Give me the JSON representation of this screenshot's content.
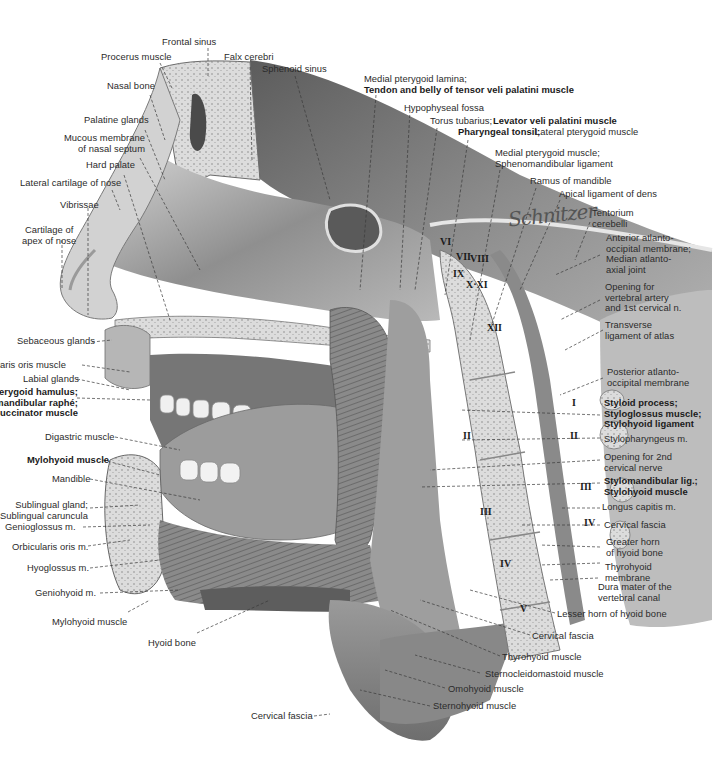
{
  "figure": {
    "type": "anatomical-illustration",
    "signature": "Schnitzer"
  },
  "labels": {
    "top": [
      {
        "id": "frontal-sinus",
        "text": "Frontal sinus",
        "bold": false
      },
      {
        "id": "procerus-muscle",
        "text": "Procerus muscle",
        "bold": false
      },
      {
        "id": "falx-cerebri",
        "text": "Falx cerebri",
        "bold": false
      },
      {
        "id": "sphenoid-sinus",
        "text": "Sphenoid sinus",
        "bold": false
      },
      {
        "id": "medial-pterygoid-lamina",
        "text": "Medial pterygoid lamina;",
        "bold": false
      },
      {
        "id": "tendon-tensor-veli-palatini",
        "text": "Tendon and belly of tensor veli palatini muscle",
        "bold": true
      },
      {
        "id": "hypophyseal-fossa",
        "text": "Hypophyseal fossa",
        "bold": false
      },
      {
        "id": "torus-tubarius",
        "text": "Torus tubarius;",
        "bold": false
      },
      {
        "id": "levator-veli-palatini",
        "text": "Levator veli palatini muscle",
        "bold": true
      },
      {
        "id": "pharyngeal-tonsil",
        "text": "Pharyngeal tonsil;",
        "bold": true
      },
      {
        "id": "lateral-pterygoid",
        "text": "Lateral pterygoid muscle",
        "bold": false
      },
      {
        "id": "medial-pterygoid-muscle",
        "text": "Medial pterygoid muscle;\nSphenomandibular ligament",
        "bold": false
      },
      {
        "id": "ramus-of-mandible",
        "text": "Ramus of mandible",
        "bold": false
      },
      {
        "id": "apical-ligament",
        "text": "Apical ligament of dens",
        "bold": false
      }
    ],
    "left": [
      {
        "id": "nasal-bone",
        "text": "Nasal bone",
        "bold": false
      },
      {
        "id": "palatine-glands",
        "text": "Palatine glands",
        "bold": false
      },
      {
        "id": "mucous-membrane-septum",
        "text": "Mucous membrane\nof nasal septum",
        "bold": false
      },
      {
        "id": "hard-palate",
        "text": "Hard palate",
        "bold": false
      },
      {
        "id": "lateral-cartilage-nose",
        "text": "Lateral cartilage of nose",
        "bold": false
      },
      {
        "id": "vibrissae",
        "text": "Vibrissae",
        "bold": false
      },
      {
        "id": "cartilage-apex-nose",
        "text": "Cartilage of\napex of nose",
        "bold": false
      },
      {
        "id": "sebaceous-glands",
        "text": "Sebaceous glands",
        "bold": false
      },
      {
        "id": "orbicularis-oris-muscle",
        "text": "Orbicularis oris muscle",
        "bold": false
      },
      {
        "id": "labial-glands",
        "text": "Labial glands",
        "bold": false
      },
      {
        "id": "pterygoid-hamulus",
        "text": "Pterygoid hamulus;\nPterygomandibular raphé;\nBuccinator muscle",
        "bold": true
      },
      {
        "id": "digastric-muscle",
        "text": "Digastric muscle",
        "bold": false
      },
      {
        "id": "mylohyoid-muscle-bold",
        "text": "Mylohyoid muscle",
        "bold": true
      },
      {
        "id": "mandible",
        "text": "Mandible",
        "bold": false
      },
      {
        "id": "sublingual-gland",
        "text": "Sublingual gland;\nSublingual caruncula",
        "bold": false
      },
      {
        "id": "genioglossus",
        "text": "Genioglossus m.",
        "bold": false
      },
      {
        "id": "orbicularis-oris-m",
        "text": "Orbicularis oris m.",
        "bold": false
      },
      {
        "id": "hyoglossus",
        "text": "Hyoglossus m.",
        "bold": false
      },
      {
        "id": "geniohyoid",
        "text": "Geniohyoid m.",
        "bold": false
      },
      {
        "id": "mylohyoid-muscle",
        "text": "Mylohyoid muscle",
        "bold": false
      },
      {
        "id": "hyoid-bone",
        "text": "Hyoid bone",
        "bold": false
      }
    ],
    "right": [
      {
        "id": "tentorium-cerebelli",
        "text": "Tentorium\ncerebelli",
        "bold": false
      },
      {
        "id": "anterior-atlanto-occipital",
        "text": "Anterior atlanto-\noccipital membrane;\nMedian atlanto-\naxial joint",
        "bold": false
      },
      {
        "id": "opening-vertebral-artery",
        "text": "Opening for\nvertebral artery\nand 1st cervical n.",
        "bold": false
      },
      {
        "id": "transverse-ligament",
        "text": "Transverse\nligament of atlas",
        "bold": false
      },
      {
        "id": "posterior-atlanto-occipital",
        "text": "Posterior atlanto-\noccipital membrane",
        "bold": false
      },
      {
        "id": "styloid-process",
        "text": "Styloid process;\nStyloglossus muscle;\nStylohyoid ligament",
        "bold": true
      },
      {
        "id": "stylopharyngeus",
        "text": "Stylopharyngeus m.",
        "bold": false
      },
      {
        "id": "opening-2nd-cervical",
        "text": "Opening for 2nd\ncervical nerve",
        "bold": false
      },
      {
        "id": "stylomandibular",
        "text": "Stylomandibular lig.;\nStylohyoid muscle",
        "bold": true
      },
      {
        "id": "longus-capitis",
        "text": "Longus capitis m.",
        "bold": false
      },
      {
        "id": "cervical-fascia-r",
        "text": "Cervical fascia",
        "bold": false
      },
      {
        "id": "greater-horn-hyoid",
        "text": "Greater horn\nof hyoid bone",
        "bold": false
      },
      {
        "id": "thyrohyoid-membrane",
        "text": "Thyrohyoid\nmembrane",
        "bold": false
      },
      {
        "id": "dura-mater",
        "text": "Dura mater of the\nvertebral canal",
        "bold": false
      }
    ],
    "bottom": [
      {
        "id": "lesser-horn-hyoid",
        "text": "Lesser horn of hyoid bone",
        "bold": false
      },
      {
        "id": "cervical-fascia-b",
        "text": "Cervical fascia",
        "bold": false
      },
      {
        "id": "thyrohyoid-muscle",
        "text": "Thyrohyoid muscle",
        "bold": false
      },
      {
        "id": "sternocleidomastoid",
        "text": "Sternocleidomastoid muscle",
        "bold": false
      },
      {
        "id": "omohyoid",
        "text": "Omohyoid muscle",
        "bold": false
      },
      {
        "id": "sternohyoid",
        "text": "Sternohyoid muscle",
        "bold": false
      },
      {
        "id": "cervical-fascia-bl",
        "text": "Cervical fascia",
        "bold": false
      }
    ]
  },
  "cranial_nerves": [
    "VI",
    "VII",
    "VIII",
    "IX",
    "X·XI",
    "XII"
  ],
  "vertebrae_anterior": [
    "II",
    "III",
    "IV",
    "V"
  ],
  "vertebrae_posterior": [
    "I",
    "II",
    "III",
    "IV"
  ],
  "colors": {
    "ink": "#2b2b2b",
    "tissue_dark": "#6a6a6a",
    "tissue_mid": "#a8a8a8",
    "tissue_light": "#d9d9d9",
    "background": "#ffffff"
  }
}
